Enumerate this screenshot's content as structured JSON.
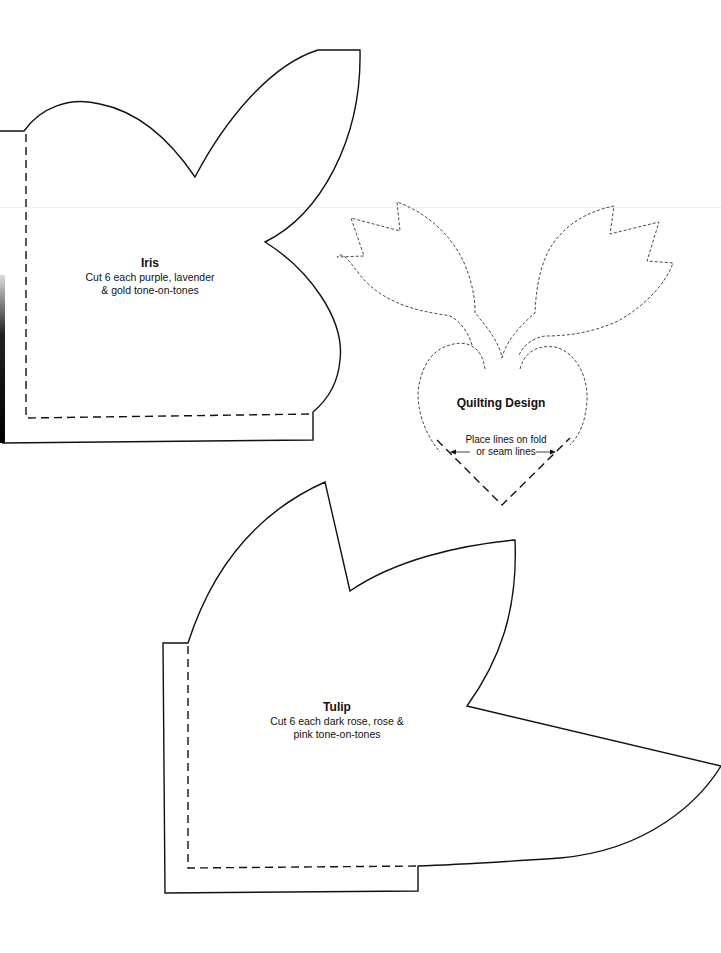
{
  "page": {
    "background": "#ffffff",
    "stroke_color": "#111111"
  },
  "pieces": {
    "iris": {
      "title": "Iris",
      "description_line1": "Cut 6 each purple, lavender",
      "description_line2": "& gold tone-on-tones"
    },
    "tulip": {
      "title": "Tulip",
      "description_line1": "Cut 6 each dark rose, rose &",
      "description_line2": "pink tone-on-tones"
    },
    "quilting_design": {
      "title": "Quilting Design",
      "note_line1": "Place lines on fold",
      "note_line2": "or seam lines"
    }
  },
  "icons": {
    "left_arrow": "left-arrow-icon",
    "right_arrow": "right-arrow-icon"
  }
}
